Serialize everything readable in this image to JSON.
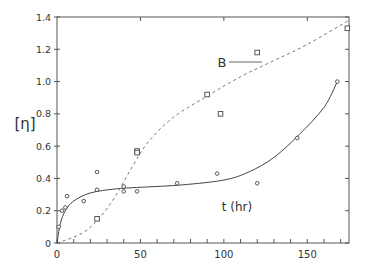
{
  "chart_data": {
    "type": "scatter",
    "title": "",
    "xlabel": "t (hr)",
    "ylabel": "[η]",
    "xlim": [
      0,
      175
    ],
    "ylim": [
      0,
      1.4
    ],
    "x_ticks": [
      "0",
      "50",
      "100",
      "150"
    ],
    "y_ticks": [
      "0",
      "0.2",
      "0.4",
      "0.6",
      "0.8",
      "1.0",
      "1.2",
      "1.4"
    ],
    "grid": false,
    "annotations": [
      {
        "text": "B",
        "x": 95,
        "y": 1.1
      }
    ],
    "series": [
      {
        "name": "A (circles, solid fit)",
        "marker": "circle",
        "line": "solid",
        "points": [
          [
            1,
            0.1
          ],
          [
            3,
            0.2
          ],
          [
            5,
            0.22
          ],
          [
            6,
            0.29
          ],
          [
            16,
            0.26
          ],
          [
            24,
            0.44
          ],
          [
            24,
            0.33
          ],
          [
            40,
            0.35
          ],
          [
            40,
            0.32
          ],
          [
            48,
            0.32
          ],
          [
            72,
            0.37
          ],
          [
            96,
            0.43
          ],
          [
            120,
            0.37
          ],
          [
            144,
            0.65
          ],
          [
            168,
            1.0
          ]
        ],
        "curve": [
          [
            0,
            0
          ],
          [
            2,
            0.12
          ],
          [
            5,
            0.2
          ],
          [
            10,
            0.26
          ],
          [
            20,
            0.31
          ],
          [
            35,
            0.335
          ],
          [
            50,
            0.345
          ],
          [
            75,
            0.36
          ],
          [
            100,
            0.39
          ],
          [
            115,
            0.44
          ],
          [
            130,
            0.53
          ],
          [
            145,
            0.67
          ],
          [
            160,
            0.84
          ],
          [
            168,
            1.0
          ]
        ]
      },
      {
        "name": "B (squares, dashed fit)",
        "marker": "square",
        "line": "dashed",
        "points": [
          [
            24,
            0.15
          ],
          [
            48,
            0.57
          ],
          [
            48,
            0.56
          ],
          [
            90,
            0.92
          ],
          [
            98,
            0.8
          ],
          [
            120,
            1.18
          ],
          [
            174,
            1.33
          ]
        ],
        "curve": [
          [
            0,
            0
          ],
          [
            15,
            0.06
          ],
          [
            25,
            0.15
          ],
          [
            35,
            0.29
          ],
          [
            45,
            0.47
          ],
          [
            55,
            0.63
          ],
          [
            70,
            0.78
          ],
          [
            90,
            0.91
          ],
          [
            110,
            1.03
          ],
          [
            130,
            1.13
          ],
          [
            150,
            1.23
          ],
          [
            175,
            1.38
          ]
        ]
      }
    ]
  }
}
